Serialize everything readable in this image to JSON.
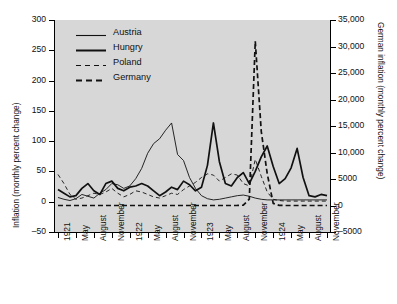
{
  "chart_data": {
    "type": "line",
    "title": "",
    "xlabel": "",
    "ylabel": "Inflation (monthly percent change)",
    "ylabel_right": "German inflation (monthly percent change)",
    "grid": false,
    "legend_position": "top-left",
    "ylim": [
      -50,
      300
    ],
    "ylim_right": [
      -5000,
      35000
    ],
    "y_ticks": [
      "-50",
      "0",
      "50",
      "100",
      "150",
      "200",
      "250",
      "300"
    ],
    "y_ticks_right": [
      "-5000",
      "0",
      "5000",
      "10,000",
      "15,000",
      "20,000",
      "25,000",
      "30,000",
      "35,000"
    ],
    "x_ticks": [
      "1921",
      "May",
      "August",
      "November",
      "1922",
      "May",
      "August",
      "November",
      "1923",
      "May",
      "August",
      "November",
      "1924",
      "May",
      "August",
      "November"
    ],
    "x": [
      "1921-02",
      "1921-03",
      "1921-04",
      "1921-05",
      "1921-06",
      "1921-07",
      "1921-08",
      "1921-09",
      "1921-10",
      "1921-11",
      "1921-12",
      "1922-01",
      "1922-02",
      "1922-03",
      "1922-04",
      "1922-05",
      "1922-06",
      "1922-07",
      "1922-08",
      "1922-09",
      "1922-10",
      "1922-11",
      "1922-12",
      "1923-01",
      "1923-02",
      "1923-03",
      "1923-04",
      "1923-05",
      "1923-06",
      "1923-07",
      "1923-08",
      "1923-09",
      "1923-10",
      "1923-11",
      "1923-12",
      "1924-01",
      "1924-02",
      "1924-03",
      "1924-04",
      "1924-05",
      "1924-06",
      "1924-07",
      "1924-08",
      "1924-09",
      "1924-10",
      "1924-11"
    ],
    "series": [
      {
        "name": "Austria",
        "style": "solid",
        "width": "thin",
        "color": "#111111",
        "axis": "left",
        "values": [
          7,
          4,
          2,
          5,
          12,
          9,
          6,
          14,
          20,
          30,
          28,
          22,
          26,
          38,
          55,
          80,
          96,
          104,
          118,
          130,
          78,
          68,
          40,
          22,
          10,
          5,
          3,
          4,
          6,
          8,
          10,
          11,
          9,
          6,
          4,
          3,
          3,
          3,
          3,
          3,
          3,
          3,
          3,
          3,
          3,
          3
        ]
      },
      {
        "name": "Hungry",
        "style": "solid",
        "width": "thick",
        "color": "#111111",
        "axis": "left",
        "values": [
          20,
          14,
          8,
          10,
          22,
          30,
          18,
          12,
          30,
          34,
          22,
          18,
          24,
          26,
          30,
          26,
          18,
          10,
          16,
          24,
          20,
          34,
          28,
          18,
          24,
          60,
          130,
          66,
          30,
          26,
          40,
          48,
          30,
          50,
          74,
          92,
          58,
          30,
          38,
          56,
          88,
          40,
          10,
          8,
          12,
          10
        ]
      },
      {
        "name": "Poland",
        "style": "dashed",
        "width": "thin",
        "color": "#111111",
        "axis": "left",
        "values": [
          45,
          30,
          12,
          4,
          6,
          10,
          14,
          12,
          16,
          22,
          14,
          8,
          12,
          18,
          16,
          12,
          8,
          6,
          10,
          14,
          12,
          20,
          26,
          32,
          40,
          46,
          44,
          34,
          40,
          46,
          44,
          30,
          26,
          70,
          42,
          16,
          4,
          2,
          1,
          1,
          1,
          1,
          1,
          1,
          1,
          1
        ]
      },
      {
        "name": "Germany",
        "style": "dashed",
        "width": "thick",
        "color": "#111111",
        "axis": "right",
        "values": [
          0,
          0,
          0,
          0,
          0,
          0,
          0,
          0,
          0,
          0,
          0,
          0,
          0,
          0,
          0,
          0,
          0,
          0,
          0,
          0,
          0,
          0,
          0,
          0,
          0,
          0,
          0,
          0,
          0,
          0,
          5,
          60,
          1200,
          31000,
          14000,
          6000,
          400,
          20,
          0,
          0,
          0,
          0,
          0,
          0,
          0,
          0
        ]
      }
    ]
  },
  "legend": {
    "items": [
      {
        "label": "Austria"
      },
      {
        "label": "Hungry"
      },
      {
        "label": "Poland"
      },
      {
        "label": "Germany"
      }
    ]
  }
}
